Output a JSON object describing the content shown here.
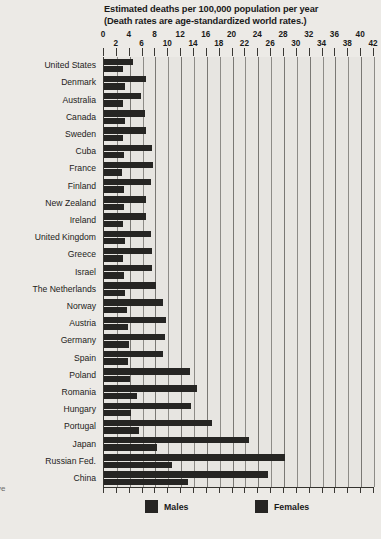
{
  "title": {
    "line1": "Estimated deaths per 100,000 population per year",
    "line2": "(Death rates are age-standardized world rates.)"
  },
  "margin_note": "ve",
  "legend": {
    "males_label": "Males",
    "females_label": "Females",
    "bar_color": "#262523"
  },
  "axis": {
    "ticks": [
      0,
      2,
      4,
      6,
      8,
      10,
      12,
      14,
      16,
      18,
      20,
      22,
      24,
      26,
      28,
      30,
      32,
      34,
      36,
      38,
      40,
      42
    ],
    "min": 0,
    "max": 42,
    "step": 2
  },
  "chart_data": {
    "type": "bar",
    "title": "Estimated deaths per 100,000 population per year (Death rates are age-standardized world rates.)",
    "subtitle": "(Death rates are age-standardized world rates.)",
    "xlabel": "Estimated deaths per 100,000 population per year",
    "ylabel": "",
    "xlim": [
      0,
      42
    ],
    "grid": true,
    "legend_position": "bottom",
    "orientation": "horizontal",
    "categories": [
      "United States",
      "Denmark",
      "Australia",
      "Canada",
      "Sweden",
      "Cuba",
      "France",
      "Finland",
      "New Zealand",
      "Ireland",
      "United Kingdom",
      "Greece",
      "Israel",
      "The Netherlands",
      "Norway",
      "Austria",
      "Germany",
      "Spain",
      "Poland",
      "Romania",
      "Hungary",
      "Portugal",
      "Japan",
      "Russian Fed.",
      "China"
    ],
    "series": [
      {
        "name": "Males",
        "values": [
          4.5,
          6.5,
          5.8,
          6.3,
          6.5,
          7.4,
          7.6,
          7.3,
          6.6,
          6.6,
          7.3,
          7.4,
          7.5,
          8.1,
          9.1,
          9.6,
          9.5,
          9.2,
          13.3,
          14.5,
          13.6,
          16.8,
          22.5,
          28.2,
          25.5
        ]
      },
      {
        "name": "Females",
        "values": [
          3.0,
          3.3,
          2.9,
          3.2,
          3.0,
          3.1,
          2.8,
          3.1,
          3.1,
          3.0,
          3.2,
          3.0,
          3.1,
          3.2,
          3.6,
          3.8,
          3.9,
          3.8,
          4.0,
          5.2,
          4.2,
          5.4,
          8.2,
          10.5,
          13.0
        ]
      }
    ]
  }
}
